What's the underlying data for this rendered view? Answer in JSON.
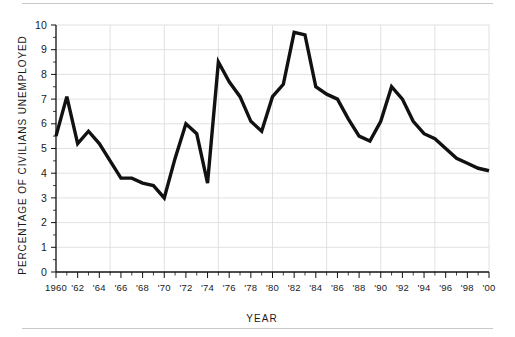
{
  "chart_data": {
    "type": "line",
    "title": "",
    "subtitle": "",
    "xlabel": "YEAR",
    "ylabel": "PERCENTAGE OF CIVILIANS UNEMPLOYED",
    "xlim": [
      1960,
      2000
    ],
    "ylim": [
      0,
      10
    ],
    "grid": true,
    "legend": "none",
    "line_color": "#111111",
    "grid_color": "#d9d9d9",
    "axis_color": "#111111",
    "x": [
      1960,
      1961,
      1962,
      1963,
      1964,
      1965,
      1966,
      1967,
      1968,
      1969,
      1970,
      1971,
      1972,
      1973,
      1974,
      1975,
      1976,
      1977,
      1978,
      1979,
      1980,
      1981,
      1982,
      1983,
      1984,
      1985,
      1986,
      1987,
      1988,
      1989,
      1990,
      1991,
      1992,
      1993,
      1994,
      1995,
      1996,
      1997,
      1998,
      1999,
      2000
    ],
    "values": [
      5.5,
      7.1,
      5.2,
      5.7,
      5.2,
      4.5,
      3.8,
      3.8,
      3.6,
      3.5,
      3.0,
      4.6,
      6.0,
      5.6,
      3.6,
      8.5,
      7.7,
      7.1,
      6.1,
      5.7,
      7.1,
      7.6,
      9.7,
      9.6,
      7.5,
      7.2,
      7.0,
      6.2,
      5.5,
      5.3,
      6.1,
      7.5,
      7.0,
      6.1,
      5.6,
      5.4,
      5.0,
      4.6,
      4.4,
      4.2,
      4.1
    ],
    "y_ticks": [
      {
        "value": 0,
        "label": "0"
      },
      {
        "value": 1,
        "label": "1"
      },
      {
        "value": 2,
        "label": "2"
      },
      {
        "value": 3,
        "label": "3"
      },
      {
        "value": 4,
        "label": "4"
      },
      {
        "value": 5,
        "label": "5"
      },
      {
        "value": 6,
        "label": "6"
      },
      {
        "value": 7,
        "label": "7"
      },
      {
        "value": 8,
        "label": "8"
      },
      {
        "value": 9,
        "label": "9"
      },
      {
        "value": 10,
        "label": "10"
      }
    ],
    "x_ticks": [
      {
        "value": 1960,
        "label": "1960"
      },
      {
        "value": 1962,
        "label": "'62"
      },
      {
        "value": 1964,
        "label": "'64"
      },
      {
        "value": 1966,
        "label": "'66"
      },
      {
        "value": 1968,
        "label": "'68"
      },
      {
        "value": 1970,
        "label": "'70"
      },
      {
        "value": 1972,
        "label": "'72"
      },
      {
        "value": 1974,
        "label": "'74"
      },
      {
        "value": 1976,
        "label": "'76"
      },
      {
        "value": 1978,
        "label": "'78"
      },
      {
        "value": 1980,
        "label": "'80"
      },
      {
        "value": 1982,
        "label": "'82"
      },
      {
        "value": 1984,
        "label": "'84"
      },
      {
        "value": 1986,
        "label": "'86"
      },
      {
        "value": 1988,
        "label": "'88"
      },
      {
        "value": 1990,
        "label": "'90"
      },
      {
        "value": 1992,
        "label": "'92"
      },
      {
        "value": 1994,
        "label": "'94"
      },
      {
        "value": 1996,
        "label": "'96"
      },
      {
        "value": 1998,
        "label": "'98"
      },
      {
        "value": 2000,
        "label": "'00"
      }
    ],
    "y_gridline_values": [
      1,
      2,
      3,
      4,
      5,
      6,
      7,
      8,
      9,
      10
    ],
    "x_gridline_values": [
      1965,
      1970,
      1975,
      1980,
      1985,
      1990,
      1995,
      2000
    ]
  }
}
